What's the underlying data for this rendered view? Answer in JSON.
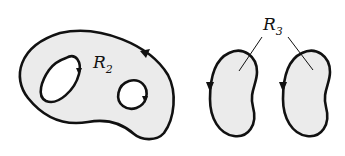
{
  "figure": {
    "regions": [
      {
        "id": "R2",
        "label": "R",
        "subscript": "2",
        "description": "region with two holes, boundary oriented positively"
      },
      {
        "id": "R3",
        "label": "R",
        "subscript": "3",
        "description": "two separate bean-shaped components"
      }
    ],
    "colors": {
      "fill": "#ebebeb",
      "stroke": "#111111",
      "background": "#ffffff"
    }
  }
}
